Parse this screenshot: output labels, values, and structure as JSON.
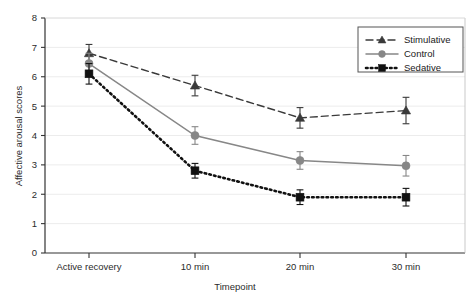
{
  "chart_data": {
    "type": "line",
    "title": "",
    "xlabel": "Timepoint",
    "ylabel": "Affective arousal scores",
    "categories": [
      "Active recovery",
      "10 min",
      "20 min",
      "30 min"
    ],
    "ylim": [
      0,
      8
    ],
    "ytick_labels": [
      "0",
      "1",
      "2",
      "3",
      "4",
      "5",
      "6",
      "7",
      "8"
    ],
    "yticks": [
      0,
      1,
      2,
      3,
      4,
      5,
      6,
      7,
      8
    ],
    "grid": true,
    "grid_axis": "y",
    "legend_position": "top-right",
    "series": [
      {
        "name": "Stimulative",
        "values": [
          6.8,
          5.7,
          4.6,
          4.85
        ],
        "errors": [
          0.3,
          0.35,
          0.35,
          0.45
        ],
        "color": "#3a3a3a",
        "marker": "triangle",
        "linestyle": "dashed"
      },
      {
        "name": "Control",
        "values": [
          6.45,
          4.0,
          3.15,
          2.97
        ],
        "errors": [
          0.35,
          0.3,
          0.3,
          0.35
        ],
        "color": "#878787",
        "marker": "circle",
        "linestyle": "solid"
      },
      {
        "name": "Sedative",
        "values": [
          6.1,
          2.8,
          1.9,
          1.9
        ],
        "errors": [
          0.35,
          0.25,
          0.25,
          0.3
        ],
        "color": "#111111",
        "marker": "square",
        "linestyle": "dotted"
      }
    ]
  },
  "legend": {
    "entries": [
      {
        "label": "Stimulative"
      },
      {
        "label": "Control"
      },
      {
        "label": "Sedative"
      }
    ]
  },
  "axes": {
    "y_title": "Affective arousal scores",
    "x_title": "Timepoint"
  }
}
